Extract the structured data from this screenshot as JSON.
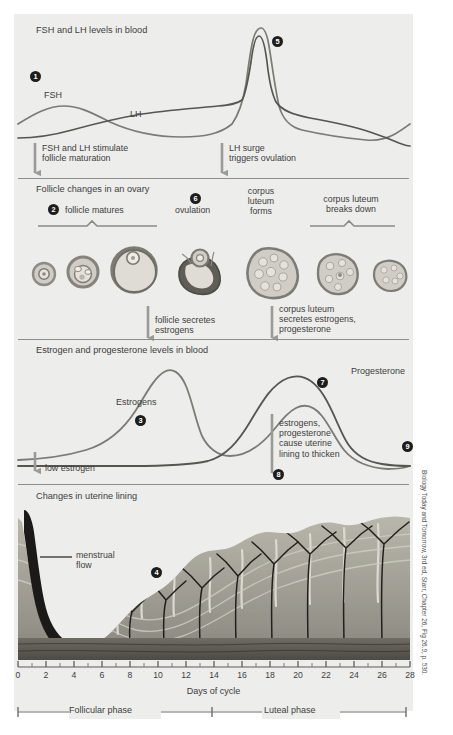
{
  "figure": {
    "credit": "Biology Today and Tomorrow, 3rd ed, Starr, Chapter 26, Fig 26.9, p. 530.",
    "background": "#ededeb",
    "ink": "#3d3d3d",
    "curve_color": "#7a7a72",
    "arrow_color": "#9a9a96"
  },
  "panel1": {
    "title": "FSH and LH levels in blood",
    "badge_1": "1",
    "badge_5": "5",
    "curve_fsh_label": "FSH",
    "curve_lh_label": "LH",
    "note_left": "FSH and LH stimulate\nfollicle maturation",
    "note_right": "LH surge\ntriggers ovulation"
  },
  "panel2": {
    "title": "Follicle changes in an ovary",
    "badge_2": "2",
    "badge_6": "6",
    "label_follicle_matures": "follicle matures",
    "label_ovulation": "ovulation",
    "label_corpus_luteum_forms": "corpus\nluteum\nforms",
    "label_corpus_luteum_breaks": "corpus luteum\nbreaks down",
    "note_left": "follicle secretes\nestrogens",
    "note_right": "corpus luteum\nsecretes estrogens,\nprogesterone"
  },
  "panel3": {
    "title": "Estrogen and progesterone levels in blood",
    "badge_3": "3",
    "badge_7": "7",
    "badge_9": "9",
    "curve_estrogens_label": "Estrogens",
    "curve_progesterone_label": "Progesterone",
    "note_left": "low estrogen",
    "note_right": "estrogens,\nprogesterone\ncause uterine\nlining to thicken"
  },
  "panel4": {
    "title": "Changes in uterine lining",
    "badge_4": "4",
    "badge_8": "8",
    "label_menstrual_flow": "menstrual\nflow"
  },
  "axis": {
    "label": "Days of cycle",
    "ticks": [
      0,
      2,
      4,
      6,
      8,
      10,
      12,
      14,
      16,
      18,
      20,
      22,
      24,
      26,
      28
    ],
    "minor_ticks": [
      1,
      3,
      5,
      7,
      9,
      11,
      13,
      15,
      17,
      19,
      21,
      23,
      25,
      27
    ],
    "range": [
      0,
      28
    ],
    "phases": [
      {
        "name": "Follicular phase",
        "start": 0,
        "end": 14
      },
      {
        "name": "Luteal phase",
        "start": 14,
        "end": 28
      }
    ]
  },
  "chart_data": {
    "type": "line",
    "xlabel": "Days of cycle",
    "xlim": [
      0,
      28
    ],
    "panels": [
      {
        "name": "FSH and LH levels in blood",
        "series": [
          {
            "name": "FSH",
            "x": [
              0,
              2,
              4,
              6,
              8,
              10,
              12,
              13,
              14,
              15,
              16,
              18,
              20,
              22,
              24,
              26,
              28
            ],
            "values": [
              42,
              46,
              44,
              38,
              32,
              28,
              26,
              34,
              64,
              36,
              28,
              25,
              23,
              22,
              22,
              28,
              40
            ]
          },
          {
            "name": "LH",
            "x": [
              0,
              2,
              4,
              6,
              8,
              10,
              12,
              13,
              14,
              15,
              16,
              18,
              20,
              22,
              24,
              26,
              28
            ],
            "values": [
              24,
              26,
              30,
              34,
              38,
              42,
              48,
              72,
              100,
              62,
              40,
              34,
              30,
              27,
              25,
              24,
              26
            ]
          }
        ]
      },
      {
        "name": "Estrogen and progesterone levels in blood",
        "series": [
          {
            "name": "Estrogens",
            "x": [
              0,
              2,
              4,
              6,
              8,
              10,
              12,
              13,
              14,
              16,
              18,
              20,
              22,
              24,
              26,
              28
            ],
            "values": [
              8,
              9,
              11,
              16,
              26,
              46,
              70,
              74,
              60,
              26,
              36,
              48,
              50,
              42,
              26,
              14
            ]
          },
          {
            "name": "Progesterone",
            "x": [
              0,
              2,
              4,
              6,
              8,
              10,
              12,
              14,
              16,
              18,
              20,
              22,
              24,
              26,
              28
            ],
            "values": [
              3,
              3,
              3,
              3,
              3,
              3,
              4,
              10,
              40,
              72,
              86,
              84,
              70,
              44,
              18
            ]
          }
        ]
      }
    ],
    "uterine_lining_thickness": {
      "x": [
        0,
        1,
        2,
        3,
        4,
        5,
        6,
        8,
        10,
        12,
        14,
        16,
        18,
        20,
        22,
        24,
        26,
        28
      ],
      "values": [
        58,
        34,
        12,
        10,
        12,
        16,
        22,
        34,
        46,
        56,
        64,
        72,
        80,
        86,
        90,
        92,
        92,
        90
      ]
    }
  }
}
